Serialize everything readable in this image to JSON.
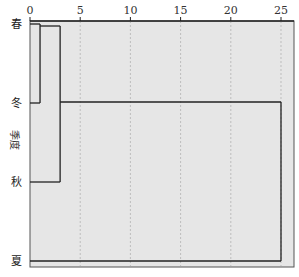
{
  "chart_data": {
    "type": "dendrogram",
    "title": "",
    "xlabel": "",
    "ylabel": "季度",
    "xlim": [
      0,
      25
    ],
    "x_ticks": [
      "0",
      "5",
      "10",
      "15",
      "20",
      "25"
    ],
    "x_tick_values": [
      0,
      5,
      10,
      15,
      20,
      25
    ],
    "grid": "vertical dashed",
    "leaves": [
      "春",
      "冬",
      "秋",
      "夏"
    ],
    "merges": [
      {
        "clusters": [
          "春",
          "冬"
        ],
        "distance": 1
      },
      {
        "clusters": [
          "春+冬",
          "秋"
        ],
        "distance": 3
      },
      {
        "clusters": [
          "春+冬+秋",
          "夏"
        ],
        "distance": 25
      }
    ],
    "colors": {
      "background": "#e6e6e6",
      "lines": "#222222",
      "grid": "#bdbdbd"
    }
  }
}
